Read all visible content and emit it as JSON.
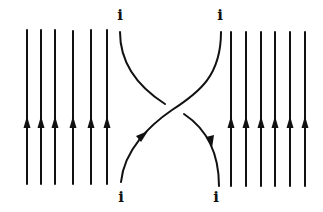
{
  "diagram": {
    "type": "braid-crossing",
    "stroke_color": "#111111",
    "background": "#ffffff",
    "labels": {
      "top_left": "i",
      "top_right": "i",
      "bottom_left": "i",
      "bottom_right": "i"
    },
    "left_strands": {
      "count": 6,
      "x": [
        27,
        41,
        55,
        73,
        91,
        107
      ],
      "y_top": 30,
      "y_bottom": 184,
      "arrow_y": 124,
      "arrow_direction": "up"
    },
    "right_strands": {
      "count": 6,
      "x": [
        231,
        246,
        261,
        275,
        290,
        305
      ],
      "y_top": 32,
      "y_bottom": 186,
      "arrow_y": 124,
      "arrow_direction": "up"
    },
    "crossing": {
      "over_strand": "bottom-left to top-right",
      "under_strand": "top-left to bottom-right",
      "center": [
        170,
        108
      ]
    }
  }
}
